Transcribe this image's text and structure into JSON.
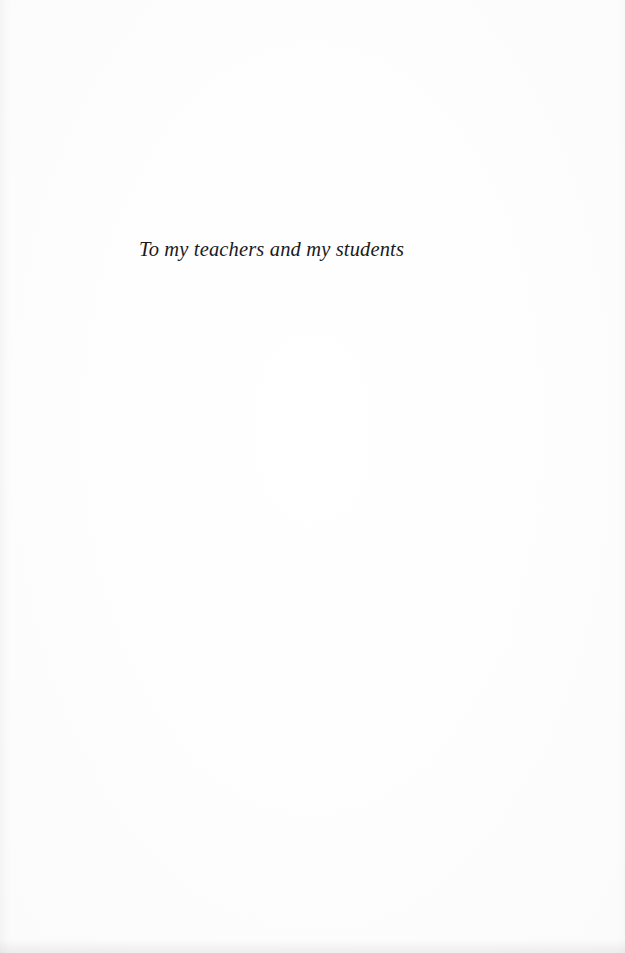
{
  "document": {
    "kind": "book-dedication-page",
    "page_background_color": "#fefefe",
    "ink_color": "#1a1a1c"
  },
  "dedication": {
    "text": "To my teachers and my students"
  }
}
